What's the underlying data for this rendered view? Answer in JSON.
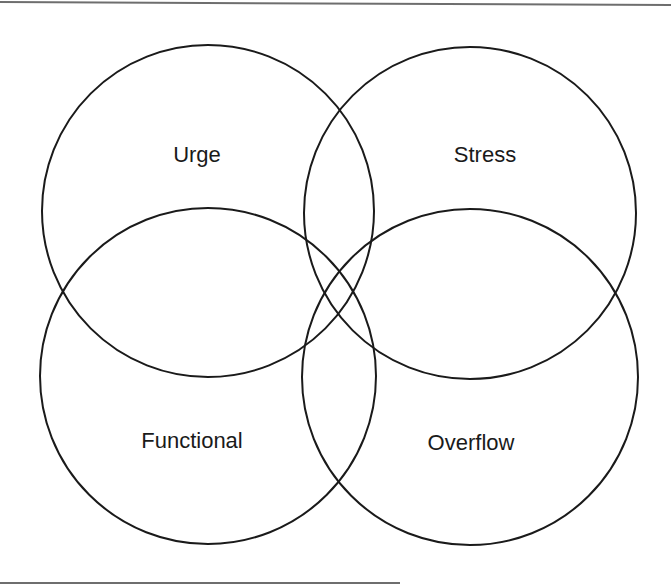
{
  "diagram": {
    "type": "venn",
    "sets": [
      {
        "id": "urge",
        "label": "Urge",
        "cx": 208,
        "cy": 211,
        "r": 166,
        "label_x": 197,
        "label_y": 155
      },
      {
        "id": "stress",
        "label": "Stress",
        "cx": 470,
        "cy": 213,
        "r": 166,
        "label_x": 485,
        "label_y": 155
      },
      {
        "id": "functional",
        "label": "Functional",
        "cx": 208,
        "cy": 376,
        "r": 168,
        "label_x": 192,
        "label_y": 441
      },
      {
        "id": "overflow",
        "label": "Overflow",
        "cx": 470,
        "cy": 377,
        "r": 168,
        "label_x": 471,
        "label_y": 443
      }
    ],
    "stroke_color": "#1a1a1a",
    "frame_color": "#6e6e6e"
  }
}
